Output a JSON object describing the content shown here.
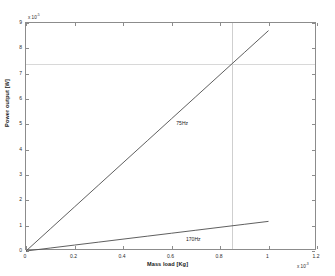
{
  "chart_data": {
    "type": "line",
    "title": "",
    "subtitle": "",
    "xlabel": "Mass load [Kg]",
    "ylabel": "Power output [W]",
    "xlim": [
      0,
      1.2
    ],
    "ylim": [
      0,
      9
    ],
    "x_exponent_label": "x 10",
    "x_exponent_value": "-3",
    "y_exponent_label": "x 10",
    "y_exponent_value": "-5",
    "xticks": [
      "0",
      "0.2",
      "0.4",
      "0.6",
      "0.8",
      "1",
      "1.2"
    ],
    "xtick_values": [
      0,
      0.2,
      0.4,
      0.6,
      0.8,
      1,
      1.2
    ],
    "yticks": [
      "0",
      "1",
      "2",
      "3",
      "4",
      "5",
      "6",
      "7",
      "8",
      "9"
    ],
    "ytick_values": [
      0,
      1,
      2,
      3,
      4,
      5,
      6,
      7,
      8,
      9
    ],
    "grid": false,
    "legend_position": "inline-annotations",
    "series": [
      {
        "name": "75Hz",
        "color": "#4d4d4d",
        "annotation": "75Hz",
        "annotation_x": 0.62,
        "annotation_y": 5.05,
        "x": [
          0,
          0.1,
          0.2,
          0.3,
          0.4,
          0.5,
          0.6,
          0.7,
          0.8,
          0.9,
          1.0
        ],
        "values": [
          0,
          0.87,
          1.74,
          2.61,
          3.48,
          4.35,
          5.22,
          6.09,
          6.96,
          7.83,
          8.7
        ]
      },
      {
        "name": "170Hz",
        "color": "#4d4d4d",
        "annotation": "170Hz",
        "annotation_x": 0.66,
        "annotation_y": 0.46,
        "x": [
          0,
          0.1,
          0.2,
          0.3,
          0.4,
          0.5,
          0.6,
          0.7,
          0.8,
          0.9,
          1.0
        ],
        "values": [
          0,
          0.117,
          0.234,
          0.351,
          0.468,
          0.585,
          0.702,
          0.819,
          0.936,
          1.053,
          1.17
        ]
      }
    ],
    "guides": [
      {
        "kind": "vertical",
        "x": 0.85,
        "color": "#cfcfcf"
      },
      {
        "kind": "horizontal",
        "y": 7.4,
        "color": "#d8d8d8"
      }
    ]
  },
  "axes": {
    "frame_color": "#8c8c8c",
    "background": "#ffffff"
  }
}
